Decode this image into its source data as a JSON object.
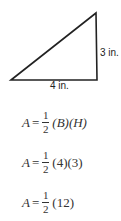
{
  "diagram": {
    "shape": "right-triangle",
    "height_label": "3 in.",
    "base_label": "4 in.",
    "stroke_color": "#222222"
  },
  "equations": [
    {
      "lhs": "A",
      "eq": "=",
      "num": "1",
      "den": "2",
      "rhs": "(B)(H)"
    },
    {
      "lhs": "A",
      "eq": "=",
      "num": "1",
      "den": "2",
      "rhs": "(4)(3)"
    },
    {
      "lhs": "A",
      "eq": "=",
      "num": "1",
      "den": "2",
      "rhs": "(12)"
    }
  ]
}
